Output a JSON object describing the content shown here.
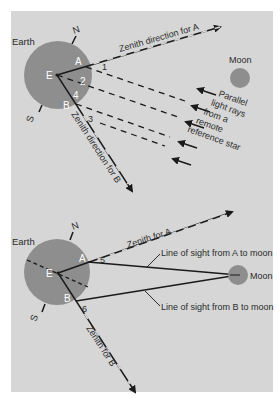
{
  "colors": {
    "panel": "#d6d6d6",
    "earth": "#8e8e8e",
    "moon": "#8e8e8e",
    "line": "#1a1a1a",
    "text": "#2b2b2b",
    "point_label": "#ffffff"
  },
  "top_diagram": {
    "earth_label": "Earth",
    "north_label": "N",
    "south_label": "S",
    "center_label": "E",
    "point_a_label": "A",
    "point_b_label": "B",
    "angle_labels": [
      "1",
      "2",
      "3",
      "4"
    ],
    "zenith_a_label": "Zenith direction for A",
    "zenith_b_label": "Zenith direction for B",
    "moon_label": "Moon",
    "rays_label_lines": [
      "Parallel",
      "light rays",
      "from a",
      "remote",
      "reference star"
    ]
  },
  "bottom_diagram": {
    "earth_label": "Earth",
    "north_label": "N",
    "south_label": "S",
    "center_label": "E",
    "point_a_label": "A",
    "point_b_label": "B",
    "angle_labels": [
      "5",
      "6"
    ],
    "zenith_a_label": "Zenith for A",
    "zenith_b_label": "Zenith for B",
    "moon_label": "Moon",
    "sight_a_label": "Line of sight from A to moon",
    "sight_b_label": "Line of sight from B to moon"
  }
}
